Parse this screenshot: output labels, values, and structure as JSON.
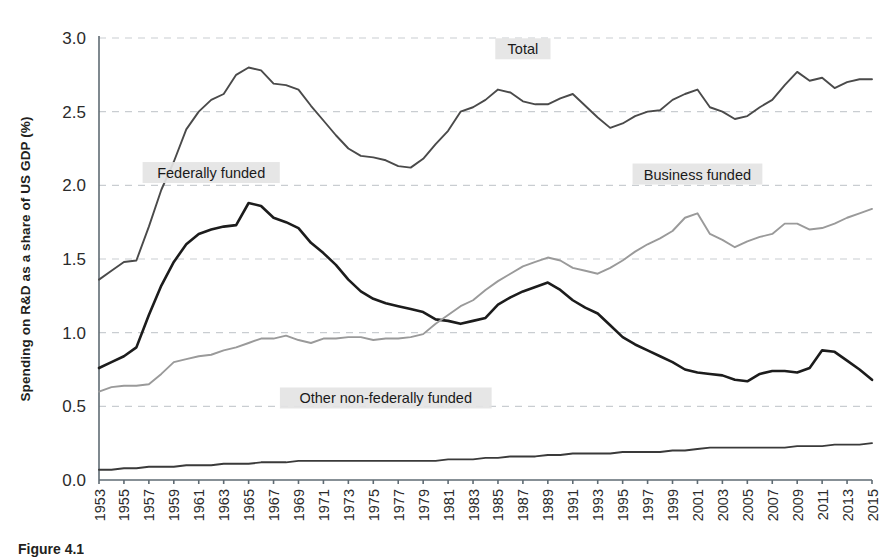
{
  "figure": {
    "caption": "Figure 4.1",
    "ylabel": "Spending on R&D as a share of US GDP (%)"
  },
  "axis": {
    "y_ticks": [
      "0.0",
      "0.5",
      "1.0",
      "1.5",
      "2.0",
      "2.5",
      "3.0"
    ],
    "x_ticks": [
      "1953",
      "1955",
      "1957",
      "1959",
      "1961",
      "1963",
      "1965",
      "1967",
      "1969",
      "1971",
      "1973",
      "1975",
      "1977",
      "1979",
      "1981",
      "1983",
      "1985",
      "1987",
      "1989",
      "1991",
      "1993",
      "1995",
      "1997",
      "1999",
      "2001",
      "2003",
      "2005",
      "2007",
      "2009",
      "2011",
      "2013",
      "2015"
    ]
  },
  "labels": {
    "total": "Total",
    "federal": "Federally funded",
    "business": "Business funded",
    "other": "Other non-federally funded"
  },
  "colors": {
    "total_line": "#4a4a4a",
    "federal_line": "#1c1c1c",
    "business_line": "#9a9a9a",
    "other_line": "#3a3a3a",
    "grid": "#c9cdd1",
    "axis": "#5f6b73",
    "label_bg": "#e4e4e4"
  },
  "chart_data": {
    "type": "line",
    "title": "",
    "xlabel": "",
    "ylabel": "Spending on R&D as a share of US GDP (%)",
    "xlim": [
      1953,
      2015
    ],
    "ylim": [
      0.0,
      3.0
    ],
    "grid": true,
    "legend_position": "inline-annotations",
    "x": [
      1953,
      1954,
      1955,
      1956,
      1957,
      1958,
      1959,
      1960,
      1961,
      1962,
      1963,
      1964,
      1965,
      1966,
      1967,
      1968,
      1969,
      1970,
      1971,
      1972,
      1973,
      1974,
      1975,
      1976,
      1977,
      1978,
      1979,
      1980,
      1981,
      1982,
      1983,
      1984,
      1985,
      1986,
      1987,
      1988,
      1989,
      1990,
      1991,
      1992,
      1993,
      1994,
      1995,
      1996,
      1997,
      1998,
      1999,
      2000,
      2001,
      2002,
      2003,
      2004,
      2005,
      2006,
      2007,
      2008,
      2009,
      2010,
      2011,
      2012,
      2013,
      2014,
      2015
    ],
    "series": [
      {
        "name": "Total",
        "color": "#4a4a4a",
        "values": [
          1.36,
          1.42,
          1.48,
          1.49,
          1.72,
          1.97,
          2.16,
          2.38,
          2.5,
          2.58,
          2.62,
          2.75,
          2.8,
          2.78,
          2.69,
          2.68,
          2.65,
          2.54,
          2.44,
          2.34,
          2.25,
          2.2,
          2.19,
          2.17,
          2.13,
          2.12,
          2.18,
          2.28,
          2.37,
          2.5,
          2.53,
          2.58,
          2.65,
          2.63,
          2.57,
          2.55,
          2.55,
          2.59,
          2.62,
          2.54,
          2.46,
          2.39,
          2.42,
          2.47,
          2.5,
          2.51,
          2.58,
          2.62,
          2.65,
          2.53,
          2.5,
          2.45,
          2.47,
          2.53,
          2.58,
          2.68,
          2.77,
          2.71,
          2.73,
          2.66,
          2.7,
          2.72,
          2.72
        ]
      },
      {
        "name": "Federally funded",
        "color": "#1c1c1c",
        "values": [
          0.76,
          0.8,
          0.84,
          0.9,
          1.12,
          1.32,
          1.48,
          1.6,
          1.67,
          1.7,
          1.72,
          1.73,
          1.88,
          1.86,
          1.78,
          1.75,
          1.71,
          1.61,
          1.54,
          1.46,
          1.36,
          1.28,
          1.23,
          1.2,
          1.18,
          1.16,
          1.14,
          1.09,
          1.08,
          1.06,
          1.08,
          1.1,
          1.19,
          1.24,
          1.28,
          1.31,
          1.34,
          1.29,
          1.22,
          1.17,
          1.13,
          1.05,
          0.97,
          0.92,
          0.88,
          0.84,
          0.8,
          0.75,
          0.73,
          0.72,
          0.71,
          0.68,
          0.67,
          0.72,
          0.74,
          0.74,
          0.73,
          0.76,
          0.88,
          0.87,
          0.81,
          0.75,
          0.68
        ]
      },
      {
        "name": "Business funded",
        "color": "#9a9a9a",
        "values": [
          0.6,
          0.63,
          0.64,
          0.64,
          0.65,
          0.72,
          0.8,
          0.82,
          0.84,
          0.85,
          0.88,
          0.9,
          0.93,
          0.96,
          0.96,
          0.98,
          0.95,
          0.93,
          0.96,
          0.96,
          0.97,
          0.97,
          0.95,
          0.96,
          0.96,
          0.97,
          0.99,
          1.06,
          1.12,
          1.18,
          1.22,
          1.29,
          1.35,
          1.4,
          1.45,
          1.48,
          1.51,
          1.49,
          1.44,
          1.42,
          1.4,
          1.44,
          1.49,
          1.55,
          1.6,
          1.64,
          1.69,
          1.78,
          1.81,
          1.67,
          1.63,
          1.58,
          1.62,
          1.65,
          1.67,
          1.74,
          1.74,
          1.7,
          1.71,
          1.74,
          1.78,
          1.81,
          1.84
        ]
      },
      {
        "name": "Other non-federally funded",
        "color": "#3a3a3a",
        "values": [
          0.07,
          0.07,
          0.08,
          0.08,
          0.09,
          0.09,
          0.09,
          0.1,
          0.1,
          0.1,
          0.11,
          0.11,
          0.11,
          0.12,
          0.12,
          0.12,
          0.13,
          0.13,
          0.13,
          0.13,
          0.13,
          0.13,
          0.13,
          0.13,
          0.13,
          0.13,
          0.13,
          0.13,
          0.14,
          0.14,
          0.14,
          0.15,
          0.15,
          0.16,
          0.16,
          0.16,
          0.17,
          0.17,
          0.18,
          0.18,
          0.18,
          0.18,
          0.19,
          0.19,
          0.19,
          0.19,
          0.2,
          0.2,
          0.21,
          0.22,
          0.22,
          0.22,
          0.22,
          0.22,
          0.22,
          0.22,
          0.23,
          0.23,
          0.23,
          0.24,
          0.24,
          0.24,
          0.25
        ]
      }
    ],
    "annotations": [
      {
        "text": "Total",
        "x": 1987,
        "y": 2.92
      },
      {
        "text": "Federally funded",
        "x": 1962,
        "y": 2.08
      },
      {
        "text": "Business funded",
        "x": 2001,
        "y": 2.07
      },
      {
        "text": "Other non-federally funded",
        "x": 1976,
        "y": 0.55
      }
    ]
  }
}
